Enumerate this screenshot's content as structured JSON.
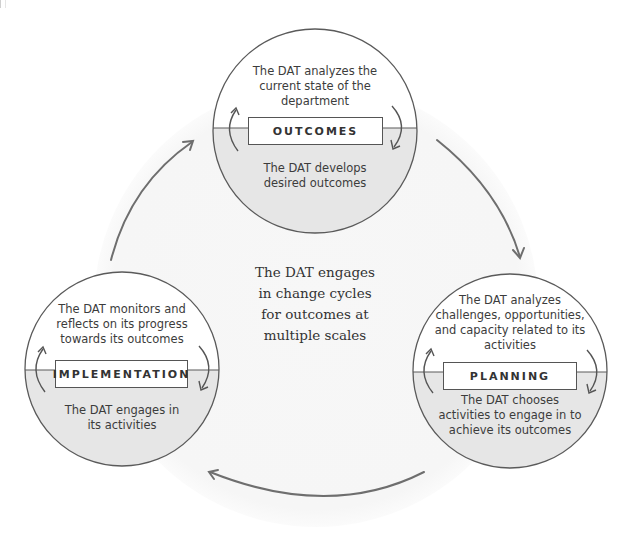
{
  "diagram": {
    "title_partial": "…",
    "center_text": "The DAT engages\nin change cycles\nfor outcomes at\nmultiple scales",
    "colors": {
      "background": "#ffffff",
      "background_circle": "#f6f6f6",
      "circle_stroke": "#5a5a5a",
      "lower_half_fill": "#e6e6e6",
      "arrow_stroke": "#6e6e6e",
      "text": "#3c3c3c"
    },
    "nodes": [
      {
        "id": "outcomes",
        "label": "OUTCOMES",
        "upper_text": "The DAT analyzes the\ncurrent state of the\ndepartment",
        "lower_text": "The DAT develops\ndesired outcomes"
      },
      {
        "id": "planning",
        "label": "PLANNING",
        "upper_text": "The DAT analyzes\nchallenges, opportunities,\nand capacity related to its\nactivities",
        "lower_text": "The DAT chooses\nactivities to engage in to\nachieve its outcomes"
      },
      {
        "id": "implementation",
        "label": "IMPLEMENTATION",
        "upper_text": "The DAT monitors and\nreflects on its progress\ntowards its outcomes",
        "lower_text": "The DAT engages in\nits activities"
      }
    ],
    "cycle_order": [
      "OUTCOMES",
      "PLANNING",
      "IMPLEMENTATION",
      "OUTCOMES"
    ]
  }
}
